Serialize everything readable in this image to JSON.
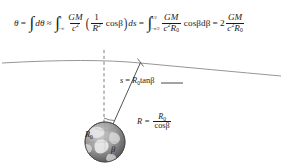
{
  "figure": {
    "background_color": "#ffffff",
    "ink_color": "#1a1a1a"
  },
  "equation": {
    "theta": "θ",
    "eq1": "=",
    "d_theta": "dθ",
    "approx": "≈",
    "int1_upper": "∞",
    "int1_lower": "−∞",
    "GM": "GM",
    "c2": "c",
    "c2_exp": "2",
    "one": "1",
    "R2": "R",
    "R2_exp": "2",
    "cos_beta": "cosβ",
    "ds": "ds",
    "eq2": "=",
    "int2_upper": "π/2",
    "int2_lower": "−π/2",
    "GM2": "GM",
    "c2R0_c": "c",
    "c2R0_exp": "2",
    "c2R0_R": "R",
    "c2R0_sub": "0",
    "cos_beta_dbeta": "cosβdβ",
    "eq3": "=",
    "two": "2",
    "GM3": "GM",
    "c3": "c",
    "c3_exp": "2",
    "R0_3": "R",
    "R0_3_sub": "0"
  },
  "diagram": {
    "label_s": "s = R₀tanβ",
    "label_s_parts": {
      "s": "s",
      "eq": "=",
      "R": "R",
      "sub": "0",
      "tan": "tanβ"
    },
    "label_R0": "R₀",
    "label_R0_parts": {
      "R": "R",
      "sub": "0"
    },
    "label_beta": "β",
    "label_R": "R = R₀/cosβ",
    "label_R_parts": {
      "R": "R",
      "eq": "=",
      "num_R": "R",
      "num_sub": "0",
      "den": "cosβ"
    },
    "earth_name": "earth-globe",
    "ray_name": "light-ray-path",
    "axis_name": "vertical-dashed-axis",
    "line_name": "impact-line"
  }
}
